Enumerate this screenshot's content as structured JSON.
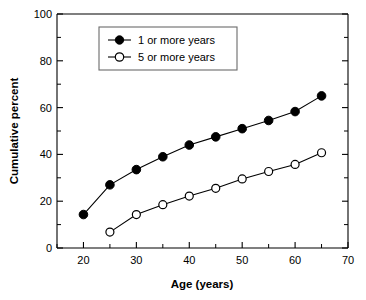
{
  "chart_data": {
    "type": "line",
    "title": "",
    "xlabel": "Age (years)",
    "ylabel": "Cumulative percent",
    "xlim": [
      15,
      70
    ],
    "ylim": [
      0,
      100
    ],
    "grid": false,
    "legend_position": "top-left",
    "x_ticks": [
      20,
      30,
      40,
      50,
      60,
      70
    ],
    "x_tick_labels": [
      "20",
      "30",
      "40",
      "50",
      "60",
      "70"
    ],
    "x_minor_ticks": [
      15,
      25,
      35,
      45,
      55,
      65
    ],
    "y_ticks": [
      0,
      20,
      40,
      60,
      80,
      100
    ],
    "y_tick_labels": [
      "0",
      "20",
      "40",
      "60",
      "80",
      "100"
    ],
    "y_minor_ticks": [
      10,
      30,
      50,
      70,
      90
    ],
    "series": [
      {
        "name": "1 or more years",
        "marker": "filled-circle",
        "x": [
          20,
          25,
          30,
          35,
          40,
          45,
          50,
          55,
          60,
          65
        ],
        "values": [
          14.3,
          27.0,
          33.5,
          39.0,
          44.0,
          47.5,
          51.0,
          54.5,
          58.3,
          65.0
        ]
      },
      {
        "name": "5 or more years",
        "marker": "open-circle",
        "x": [
          25,
          30,
          35,
          40,
          45,
          50,
          55,
          60,
          65
        ],
        "values": [
          6.8,
          14.3,
          18.5,
          22.2,
          25.5,
          29.5,
          32.7,
          35.7,
          40.7
        ]
      }
    ]
  },
  "legend": {
    "entries": [
      {
        "label": "1 or more years"
      },
      {
        "label": "5 or more years"
      }
    ]
  },
  "axes": {
    "x_title": "Age (years)",
    "y_title": "Cumulative percent"
  },
  "colors": {
    "line": "#000000",
    "marker_fill": "#000000",
    "marker_open_fill": "#ffffff",
    "background": "#ffffff",
    "legend_border": "#6b6b6b"
  }
}
